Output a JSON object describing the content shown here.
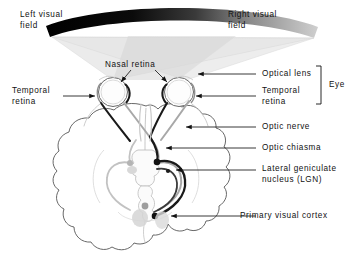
{
  "diagram": {
    "colors": {
      "ink": "#111111",
      "right_field_band_dark": "#000000",
      "left_field_band_light": "#c8c8c8",
      "light_cone": "#e9e9e9",
      "light_cone_overlap": "#d2d2d2",
      "brain_outline": "#555555",
      "pathway_contralateral_dark": "#1a1a1a",
      "pathway_ipsilateral_gray": "#a6a6a6",
      "leader_line": "#333333"
    },
    "labels": {
      "left_visual_field": "Left visual\nfield",
      "right_visual_field": "Right visual\nfield",
      "nasal_retina": "Nasal retina",
      "temporal_retina_left": "Temporal\nretina",
      "optical_lens": "Optical lens",
      "temporal_retina_right": "Temporal\nretina",
      "eye_bracket": "Eye",
      "optic_nerve": "Optic nerve",
      "optic_chiasma": "Optic chiasma",
      "lgn": "Lateral geniculate\nnucleus (LGN)",
      "primary_visual_cortex": "Primary visual cortex"
    },
    "structures": [
      {
        "name": "left-eye",
        "label": "Left eye"
      },
      {
        "name": "right-eye",
        "label": "Right eye"
      },
      {
        "name": "optic-chiasma",
        "label": "Optic chiasma"
      },
      {
        "name": "left-lgn",
        "label": "Left LGN"
      },
      {
        "name": "right-lgn",
        "label": "Right LGN"
      },
      {
        "name": "primary-visual-cortex",
        "label": "Primary visual cortex"
      }
    ]
  }
}
